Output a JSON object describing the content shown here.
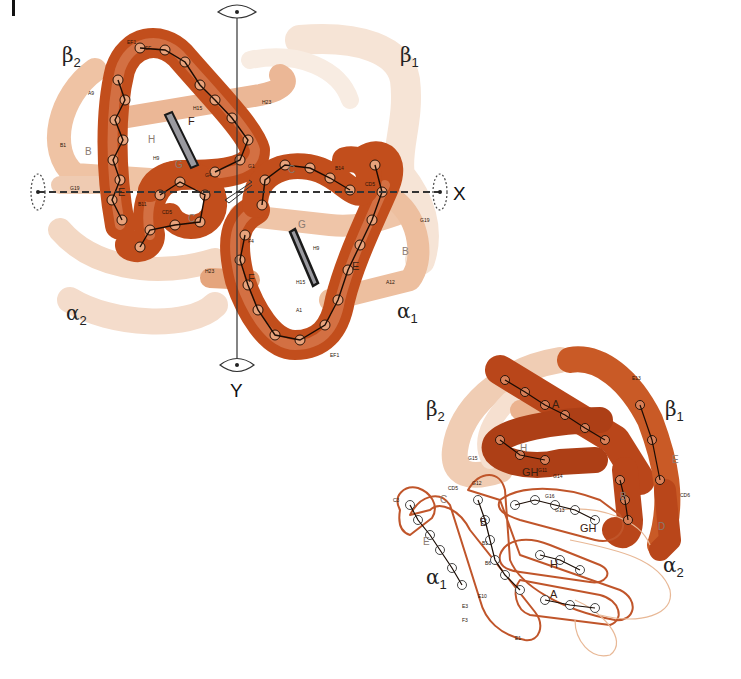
{
  "figure": {
    "panel_label": "I",
    "colors": {
      "tube_dark": "#b9461a",
      "tube_mid": "#d46a33",
      "tube_light": "#efc7ad",
      "tube_faint": "#f5e2d4",
      "outline": "#c0552a",
      "ink": "#1a1a1a",
      "heme_fill": "#9a9aa0"
    },
    "top_view": {
      "subunits": [
        {
          "name": "beta2",
          "symbol": "β",
          "sub": "2"
        },
        {
          "name": "beta1",
          "symbol": "β",
          "sub": "1"
        },
        {
          "name": "alpha2",
          "symbol": "α",
          "sub": "2"
        },
        {
          "name": "alpha1",
          "symbol": "α",
          "sub": "1"
        }
      ],
      "axes": [
        {
          "name": "x-axis",
          "label": "X"
        },
        {
          "name": "y-axis",
          "label": "Y"
        }
      ],
      "helix_labels": {
        "beta2_E": "E",
        "beta2_F": "F",
        "beta2_B": "B",
        "beta2_H": "H",
        "beta2_G": "G",
        "beta2_C": "C",
        "alpha1_E": "E",
        "alpha1_F": "F",
        "alpha1_G": "G",
        "alpha1_B": "B",
        "alpha1_C": "C"
      },
      "residue_labels": {
        "EF1_top": "EF1",
        "EF": "EF",
        "A9": "A9",
        "B1": "B1",
        "H15": "H15",
        "H9": "H9",
        "G19": "G19",
        "B11": "B11",
        "CD5": "CD5",
        "G1": "G1",
        "G4": "G4",
        "H23": "H23",
        "B14": "B14",
        "CD5_r": "CD5",
        "G19_r": "G19",
        "H9_r": "H9",
        "H15_r": "H15",
        "A12": "A12",
        "A1": "A1",
        "EF1_bottom": "EF1",
        "H23_l": "H23",
        "F4": "F4"
      }
    },
    "bottom_view": {
      "subunits": [
        {
          "name": "beta2",
          "symbol": "β",
          "sub": "2"
        },
        {
          "name": "beta1",
          "symbol": "β",
          "sub": "1"
        },
        {
          "name": "alpha1",
          "symbol": "α",
          "sub": "1"
        },
        {
          "name": "alpha2",
          "symbol": "α",
          "sub": "2"
        }
      ],
      "helix_labels": {
        "beta_A": "A",
        "beta_GH": "GH",
        "beta_E": "E",
        "beta_B": "B",
        "beta_H": "H",
        "alpha_C": "C",
        "alpha_E": "E",
        "alpha_B": "B",
        "alpha_GH": "GH",
        "alpha_H": "H",
        "alpha_A": "A",
        "alpha2_D": "D"
      },
      "residue_labels": {
        "G15": "G15",
        "G12": "G12",
        "G11": "G11",
        "G14": "G14",
        "G13": "G13",
        "G16": "G16",
        "B6": "B6",
        "E10": "E10",
        "E3": "E3",
        "CD5": "CD5",
        "C3": "C3",
        "E13": "E13",
        "B1": "B1",
        "E1": "E1",
        "CD6": "CD6",
        "F3": "F3"
      }
    }
  }
}
